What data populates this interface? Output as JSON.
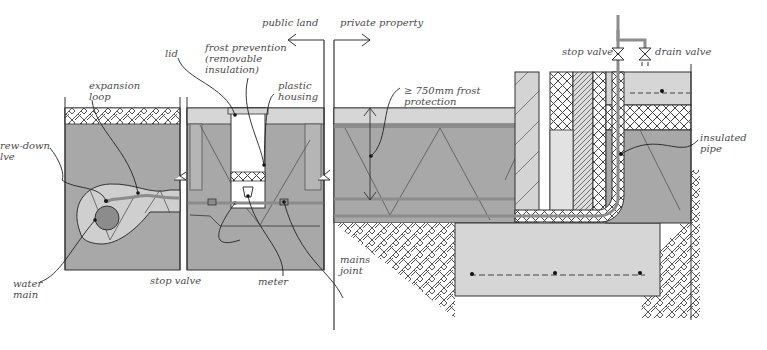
{
  "diagram": {
    "colors": {
      "soil": "#a8a8a8",
      "gravel": "#d6d6d6",
      "pipe": "#8c8c8c",
      "insulation_fill": "#ffffff",
      "line": "#333333",
      "label": "#4a4a4a",
      "background": "#ffffff"
    },
    "boundary": {
      "left_label": "public land",
      "right_label": "private property"
    },
    "labels": {
      "expansion_loop": "expansion\nloop",
      "screw_down_valve": "rew-down\nlve",
      "water_main": "water\nmain",
      "lid": "lid",
      "frost_prevention": "frost prevention\n(removable\ninsulation)",
      "plastic_housing": "plastic\nhousing",
      "stop_valve_chamber": "stop valve",
      "meter": "meter",
      "mains_joint": "mains\njoint",
      "frost_protection": "≥ 750mm frost\nprotection",
      "stop_valve_building": "stop valve",
      "drain_valve": "drain valve",
      "insulated_pipe": "insulated\npipe"
    },
    "dimensions": {
      "frost_depth": "≥ 750mm"
    },
    "icons": {
      "valve": "bowtie-valve-icon",
      "boundary_arrow": "arrow-icon",
      "break_line": "zigzag-break-icon"
    }
  }
}
